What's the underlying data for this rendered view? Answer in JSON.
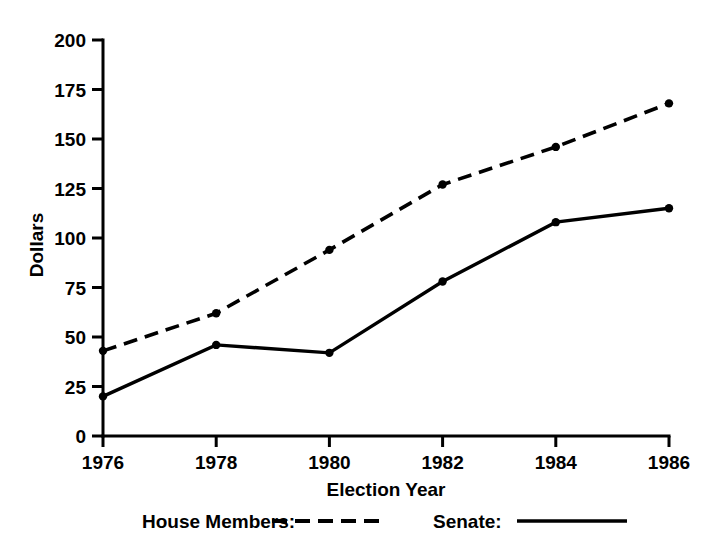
{
  "chart_data": {
    "type": "line",
    "title": "",
    "subtitle": "",
    "xlabel": "Election Year",
    "ylabel": "Dollars",
    "categories": [
      "1976",
      "1978",
      "1980",
      "1982",
      "1984",
      "1986"
    ],
    "x": [
      1976,
      1978,
      1980,
      1982,
      1984,
      1986
    ],
    "xlim": [
      1976,
      1986
    ],
    "ylim": [
      0,
      200
    ],
    "yticks": [
      0,
      25,
      50,
      75,
      100,
      125,
      150,
      175,
      200
    ],
    "ytick_labels": [
      "0",
      "25",
      "50",
      "75",
      "100",
      "125",
      "150",
      "175",
      "200"
    ],
    "xtick_labels": [
      "1976",
      "1978",
      "1980",
      "1982",
      "1984",
      "1986"
    ],
    "grid": false,
    "legend_position": "below",
    "series": [
      {
        "name": "House Members:",
        "style": "dashed",
        "color": "#000000",
        "marker": "dot",
        "values": [
          43,
          62,
          94,
          127,
          146,
          168
        ]
      },
      {
        "name": "Senate:",
        "style": "solid",
        "color": "#000000",
        "marker": "dot",
        "values": [
          20,
          46,
          42,
          78,
          108,
          115
        ]
      }
    ]
  },
  "axes": {
    "y_axis_name": "Dollars",
    "x_axis_name": "Election Year"
  },
  "legend": {
    "items": [
      {
        "label": "House Members:",
        "style": "dashed"
      },
      {
        "label": "Senate:",
        "style": "solid"
      }
    ]
  },
  "colors": {
    "ink": "#000000",
    "background": "#ffffff"
  }
}
